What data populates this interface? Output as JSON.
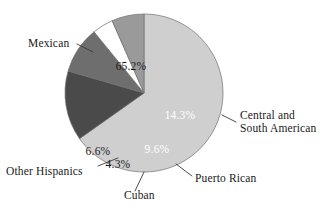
{
  "figure": {
    "background_color": "#ffffff",
    "outline_color": "#6f6f6f"
  },
  "chart_data": {
    "type": "pie",
    "title": "",
    "subtitle": "",
    "xlabel": "",
    "ylabel": "",
    "grid": false,
    "legend_position": "none",
    "label_style": "callout-with-leader-lines",
    "start_angle_deg": -90,
    "direction": "clockwise",
    "categories": [
      "Mexican",
      "Central and South American",
      "Puerto Rican",
      "Cuban",
      "Other Hispanics"
    ],
    "values": [
      65.2,
      14.3,
      9.6,
      4.3,
      6.6
    ],
    "value_labels": [
      "65.2%",
      "14.3%",
      "9.6%",
      "4.3%",
      "6.6%"
    ],
    "colors": [
      "#cfcfcf",
      "#4a4a4a",
      "#6e6e6e",
      "#ffffff",
      "#9a9a9a"
    ],
    "value_label_colors": [
      "#1a1a1a",
      "#ffffff",
      "#ffffff",
      "#1a1a1a",
      "#1a1a1a"
    ],
    "total": 100.0,
    "units": "percent"
  },
  "labels": {
    "mexican": {
      "text": "Mexican",
      "percent": "65.2%",
      "x": 28,
      "y": 47,
      "anchor": "start",
      "pct_x": 131,
      "pct_y": 70,
      "leader": {
        "x1": 77,
        "y1": 44,
        "x2": 93,
        "y2": 52
      }
    },
    "central_south_american": {
      "line1": "Central and",
      "line2": "South American",
      "percent": "14.3%",
      "x": 240,
      "y": 119,
      "line2_y": 132,
      "anchor": "start",
      "pct_x": 180,
      "pct_y": 119,
      "leader": {
        "x1": 222,
        "y1": 115,
        "x2": 236,
        "y2": 122
      }
    },
    "puerto_rican": {
      "text": "Puerto Rican",
      "percent": "9.6%",
      "x": 195,
      "y": 182,
      "anchor": "start",
      "pct_x": 157,
      "pct_y": 153,
      "leader": {
        "x1": 176,
        "y1": 164,
        "x2": 192,
        "y2": 176
      }
    },
    "cuban": {
      "text": "Cuban",
      "percent": "4.3%",
      "x": 124,
      "y": 199,
      "anchor": "start",
      "pct_x": 118,
      "pct_y": 168,
      "leader": {
        "x1": 144,
        "y1": 172,
        "x2": 135,
        "y2": 191
      }
    },
    "other_hispanics": {
      "text": "Other Hispanics",
      "percent": "6.6%",
      "x": 6,
      "y": 175,
      "anchor": "start",
      "pct_x": 98,
      "pct_y": 155,
      "leader": {
        "x1": 98,
        "y1": 166,
        "x2": 118,
        "y2": 158
      }
    }
  },
  "geometry": {
    "center_x": 144,
    "center_y": 93,
    "radius": 79
  }
}
